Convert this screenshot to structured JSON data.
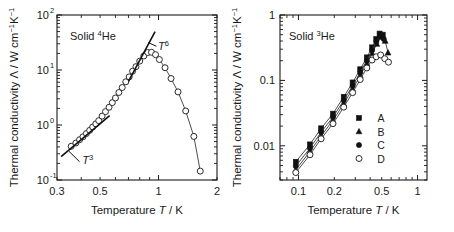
{
  "figure": {
    "panels": [
      {
        "id": "left",
        "annotation": "Solid",
        "annotation_isotope_sup": "4",
        "annotation_isotope_el": "He",
        "ylabel_main": "Thermal conductivity",
        "ylabel_symbol": "Λ",
        "ylabel_units": "/ W cm",
        "ylabel_units_sup1": "−1",
        "ylabel_units_k": "K",
        "ylabel_units_sup2": "−1",
        "xlabel_main": "Temperature",
        "xlabel_symbol": "T",
        "xlabel_units": "/ K",
        "power_law_low": "T",
        "power_law_low_exp": "3",
        "power_law_high": "T",
        "power_law_high_exp": "6",
        "ytick_labels": [
          "10",
          "10",
          "10",
          "10"
        ],
        "ytick_exponents": [
          "-1",
          "0",
          "1",
          "2"
        ],
        "xtick_labels": [
          "0.3",
          "0.5",
          "1",
          "2"
        ]
      },
      {
        "id": "right",
        "annotation": "Solid",
        "annotation_isotope_sup": "3",
        "annotation_isotope_el": "He",
        "ylabel_main": "Thermal conductivity",
        "ylabel_symbol": "Λ",
        "ylabel_units": "/ W cm",
        "ylabel_units_sup1": "−1",
        "ylabel_units_k": "K",
        "ylabel_units_sup2": "−1",
        "xlabel_main": "Temperature",
        "xlabel_symbol": "T",
        "xlabel_units": "/ K",
        "ytick_labels": [
          "0.01",
          "0.1",
          "1"
        ],
        "xtick_labels": [
          "0.1",
          "0.2",
          "0.5",
          "1"
        ],
        "legend": [
          {
            "marker": "filled-square",
            "label": "A"
          },
          {
            "marker": "filled-triangle",
            "label": "B"
          },
          {
            "marker": "filled-circle",
            "label": "C"
          },
          {
            "marker": "open-circle",
            "label": "D"
          }
        ]
      }
    ]
  },
  "chart_data": [
    {
      "type": "line",
      "panel": "left",
      "title": "Solid 4He",
      "xlabel": "Temperature T / K",
      "ylabel": "Thermal conductivity Λ / W cm−1K−1",
      "xscale": "log",
      "yscale": "log",
      "xlim": [
        0.3,
        2
      ],
      "ylim": [
        0.1,
        100
      ],
      "xticks": [
        0.3,
        0.5,
        1,
        2
      ],
      "yticks": [
        0.1,
        1,
        10,
        100
      ],
      "grid": false,
      "legend": null,
      "marker": "open-circle",
      "series": [
        {
          "name": "Solid 4He thermal conductivity",
          "x": [
            0.355,
            0.375,
            0.392,
            0.408,
            0.425,
            0.442,
            0.458,
            0.475,
            0.492,
            0.512,
            0.533,
            0.556,
            0.578,
            0.6,
            0.625,
            0.65,
            0.678,
            0.706,
            0.735,
            0.765,
            0.8,
            0.84,
            0.88,
            0.92,
            0.965,
            1.01,
            1.08,
            1.16,
            1.26,
            1.38,
            1.52,
            1.64
          ],
          "y": [
            0.41,
            0.47,
            0.54,
            0.61,
            0.7,
            0.8,
            0.92,
            1.05,
            1.2,
            1.45,
            1.75,
            2.1,
            2.55,
            3.1,
            3.9,
            4.8,
            6.1,
            7.5,
            9.5,
            11.5,
            14.5,
            18.0,
            20.8,
            21.0,
            19.0,
            15.5,
            11.0,
            7.0,
            4.0,
            1.8,
            0.62,
            0.145
          ]
        }
      ],
      "annotations": [
        {
          "text": "T^3",
          "meaning": "low-temperature T-cubed power law guide line",
          "line_x": [
            0.315,
            0.56
          ],
          "line_y": [
            0.265,
            1.48
          ]
        },
        {
          "text": "T^6",
          "meaning": "high-temperature T-to-the-sixth power law guide line",
          "line_x": [
            0.7,
            0.96
          ],
          "line_y": [
            6.2,
            50.0
          ]
        }
      ]
    },
    {
      "type": "line",
      "panel": "right",
      "title": "Solid 3He",
      "xlabel": "Temperature T / K",
      "ylabel": "Thermal conductivity Λ / W cm−1K−1",
      "xscale": "log",
      "yscale": "log",
      "xlim": [
        0.07,
        1.2
      ],
      "ylim": [
        0.003,
        1
      ],
      "xticks": [
        0.1,
        0.2,
        0.5,
        1
      ],
      "yticks": [
        0.01,
        0.1,
        1
      ],
      "grid": false,
      "legend_position": "lower-right",
      "series": [
        {
          "name": "A",
          "marker": "filled-square",
          "x": [
            0.095,
            0.125,
            0.155,
            0.195,
            0.24,
            0.285,
            0.33,
            0.375,
            0.415,
            0.45,
            0.48,
            0.51
          ],
          "y": [
            0.0057,
            0.0105,
            0.0185,
            0.031,
            0.056,
            0.093,
            0.148,
            0.225,
            0.32,
            0.43,
            0.52,
            0.5
          ]
        },
        {
          "name": "B",
          "marker": "filled-triangle",
          "x": [
            0.095,
            0.125,
            0.155,
            0.195,
            0.24,
            0.285,
            0.33,
            0.375,
            0.415,
            0.455,
            0.495,
            0.535,
            0.565
          ],
          "y": [
            0.0043,
            0.0082,
            0.0142,
            0.0245,
            0.044,
            0.074,
            0.118,
            0.18,
            0.26,
            0.36,
            0.46,
            0.4,
            0.265
          ]
        },
        {
          "name": "C",
          "marker": "filled-circle",
          "x": [
            0.095,
            0.125,
            0.155,
            0.195,
            0.24,
            0.285,
            0.33,
            0.375,
            0.415,
            0.45,
            0.485,
            0.52
          ],
          "y": [
            0.0049,
            0.0092,
            0.0162,
            0.0275,
            0.0495,
            0.083,
            0.132,
            0.2,
            0.288,
            0.39,
            0.48,
            0.43
          ]
        },
        {
          "name": "D",
          "marker": "open-circle",
          "x": [
            0.095,
            0.125,
            0.155,
            0.195,
            0.24,
            0.285,
            0.33,
            0.375,
            0.415,
            0.45,
            0.49,
            0.53,
            0.57
          ],
          "y": [
            0.0039,
            0.0073,
            0.0128,
            0.0218,
            0.039,
            0.065,
            0.103,
            0.155,
            0.205,
            0.23,
            0.245,
            0.215,
            0.19
          ]
        }
      ]
    }
  ]
}
